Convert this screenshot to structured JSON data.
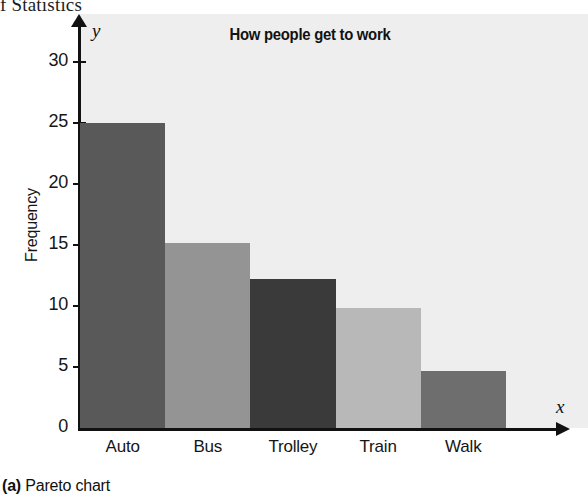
{
  "page_header": "f Statistics",
  "figure": {
    "caption_marker": "(a)",
    "caption_text": "Pareto chart",
    "background_color": "#eeeeee"
  },
  "chart_data": {
    "type": "bar",
    "title": "How people get to work",
    "xlabel": "",
    "ylabel": "Frequency",
    "x_axis_name": "x",
    "y_axis_name": "y",
    "categories": [
      "Auto",
      "Bus",
      "Trolley",
      "Train",
      "Walk"
    ],
    "values": [
      25,
      15.2,
      12.2,
      9.8,
      4.7
    ],
    "bar_colors": [
      "#595959",
      "#949494",
      "#3a3a3a",
      "#b8b8b8",
      "#6e6e6e"
    ],
    "ylim": [
      0,
      30
    ],
    "y_ticks": [
      0,
      5,
      10,
      15,
      20,
      25,
      30
    ],
    "y_tick_labels": [
      "0",
      "5",
      "10",
      "15",
      "20",
      "25",
      "30"
    ],
    "grid": false,
    "legend": "none",
    "axis_arrows": true
  }
}
